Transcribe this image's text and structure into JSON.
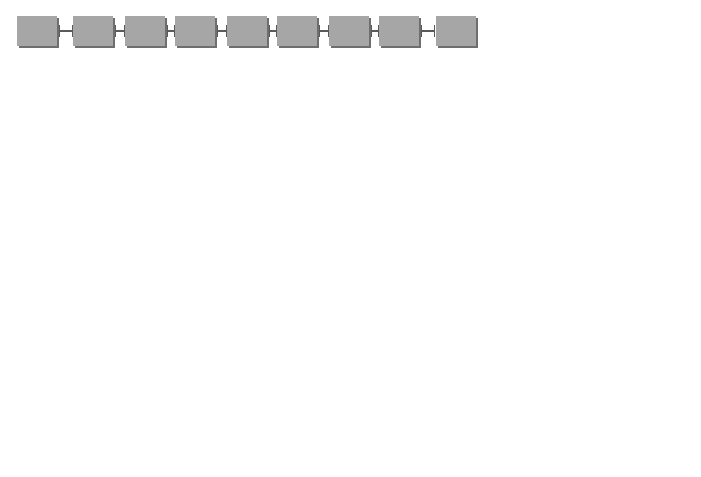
{
  "polypeptide_chain": {
    "amino_acids": [
      "A1",
      "A2",
      "A3",
      "A4",
      "A5",
      "A6",
      "A7",
      "A8",
      "A9"
    ],
    "box_color": "#a6a6a6"
  },
  "panels": {
    "a": {
      "badge": "a",
      "title": "Polypeptide chain",
      "text": ". Protein structure is established by the amino acid sequence in a polypeptide chain."
    },
    "b": {
      "badge": "b",
      "title": "Myoglobin",
      "text": ". Attraction between R groups plays a large role in forming globular proteins such as myoglobin, a protein involved in the storage of oxygen in muscle tissue."
    },
    "c": {
      "badge": "c",
      "title": "Hemoglobin",
      "text": ". A single hemoglobin molecule contains four globular subunits, each structurally similar to myoglobin. Hemoglobin transports oxygen in the blood."
    },
    "d": {
      "badge": "d",
      "title": "Keratin",
      "text": ". In keratin, a structural protein in skin and hair, three fibrous subunits intertwine like the strands of a rope."
    }
  },
  "labels": {
    "globular_subunit": "Globular protein subunit"
  },
  "colors": {
    "badge": "#5a5a5a",
    "tube": "#8c8c8c",
    "text": "#2a2a2a"
  }
}
